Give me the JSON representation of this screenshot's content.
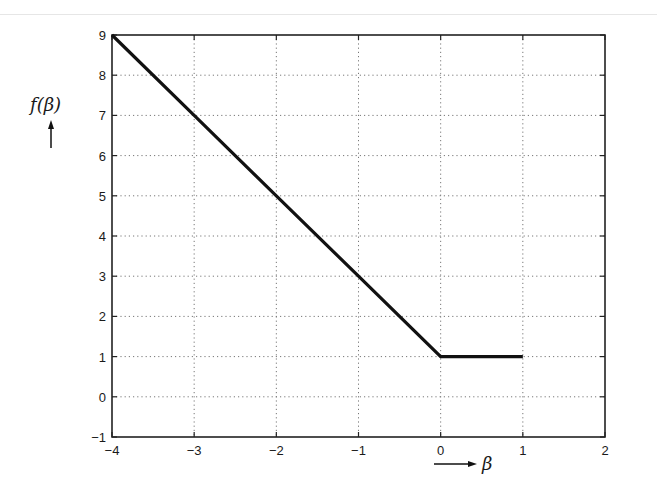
{
  "chart_data": {
    "type": "line",
    "title": "",
    "xlabel": "β",
    "ylabel": "f(β)",
    "xlim": [
      -4,
      2
    ],
    "ylim": [
      -1,
      9
    ],
    "grid": true,
    "x_ticks": [
      -4,
      -3,
      -2,
      -1,
      0,
      1,
      2
    ],
    "y_ticks": [
      -1,
      0,
      1,
      2,
      3,
      4,
      5,
      6,
      7,
      8,
      9
    ],
    "x_tick_labels": [
      "−4",
      "−3",
      "−2",
      "−1",
      "0",
      "1",
      "2"
    ],
    "y_tick_labels": [
      "−1",
      "0",
      "1",
      "2",
      "3",
      "4",
      "5",
      "6",
      "7",
      "8",
      "9"
    ],
    "series": [
      {
        "name": "f(β)",
        "x": [
          -4,
          -3,
          -2,
          -1,
          0,
          1
        ],
        "y": [
          9,
          7,
          5,
          3,
          1,
          1
        ]
      }
    ],
    "legend": null
  },
  "labels": {
    "ylabel": "f(β)",
    "xlabel": "β"
  }
}
